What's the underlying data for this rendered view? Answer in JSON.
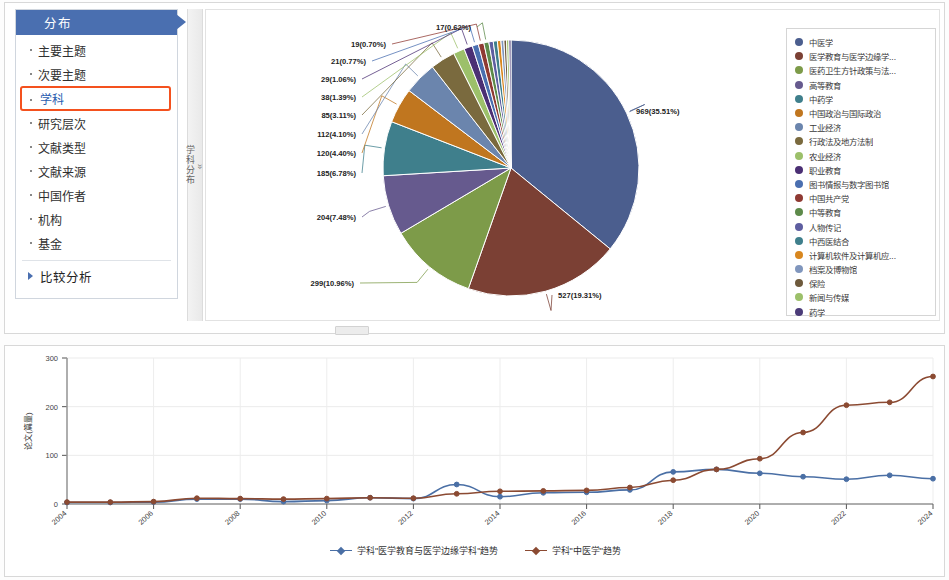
{
  "sidebar": {
    "header": "分布",
    "items": [
      {
        "label": "主要主题",
        "selected": false
      },
      {
        "label": "次要主题",
        "selected": false
      },
      {
        "label": "学科",
        "selected": true
      },
      {
        "label": "研究层次",
        "selected": false
      },
      {
        "label": "文献类型",
        "selected": false
      },
      {
        "label": "文献来源",
        "selected": false
      },
      {
        "label": "中国作者",
        "selected": false
      },
      {
        "label": "机构",
        "selected": false
      },
      {
        "label": "基金",
        "selected": false
      }
    ],
    "footer_item": "比较分析",
    "selected_border_color": "#f4511e",
    "header_color": "#4a6fb0"
  },
  "vertical_tab": {
    "label": "学科分布",
    "chevron": "»"
  },
  "chart_data": [
    {
      "type": "pie",
      "title": "",
      "legend_position": "right",
      "total": 2729,
      "slices": [
        {
          "label": "中医学",
          "value": 969,
          "percent": "35.51%",
          "data_label": "969(35.51%)",
          "color": "#4b5e8e"
        },
        {
          "label": "医学教育与医学边缘学...",
          "value": 527,
          "percent": "19.31%",
          "data_label": "527(19.31%)",
          "color": "#7b4034"
        },
        {
          "label": "医药卫生方针政策与法...",
          "value": 299,
          "percent": "10.96%",
          "data_label": "299(10.96%)",
          "color": "#7d9b49"
        },
        {
          "label": "高等教育",
          "value": 204,
          "percent": "7.48%",
          "data_label": "204(7.48%)",
          "color": "#665a8e"
        },
        {
          "label": "中药学",
          "value": 185,
          "percent": "6.78%",
          "data_label": "185(6.78%)",
          "color": "#3f7f8c"
        },
        {
          "label": "中国政治与国际政治",
          "value": 120,
          "percent": "4.40%",
          "data_label": "120(4.40%)",
          "color": "#c0761f"
        },
        {
          "label": "工业经济",
          "value": 112,
          "percent": "4.10%",
          "data_label": "112(4.10%)",
          "color": "#6b85ad"
        },
        {
          "label": "行政法及地方法制",
          "value": 85,
          "percent": "3.11%",
          "data_label": "85(3.11%)",
          "color": "#7a6a3e"
        },
        {
          "label": "农业经济",
          "value": 38,
          "percent": "1.39%",
          "data_label": "38(1.39%)",
          "color": "#9cc06a"
        },
        {
          "label": "职业教育",
          "value": 29,
          "percent": "1.06%",
          "data_label": "29(1.06%)",
          "color": "#4b2f74"
        },
        {
          "label": "图书情报与数字图书馆",
          "value": 21,
          "percent": "0.77%",
          "data_label": "21(0.77%)",
          "color": "#4a6fb0"
        },
        {
          "label": "中国共产党",
          "value": 19,
          "percent": "0.70%",
          "data_label": "19(0.70%)",
          "color": "#8f3a33"
        },
        {
          "label": "中等教育",
          "value": 17,
          "percent": "0.62%",
          "data_label": "17(0.62%)",
          "color": "#5d8a4a"
        },
        {
          "label": "人物传记",
          "value": 15,
          "percent": "",
          "data_label": "",
          "color": "#5e5ea0"
        },
        {
          "label": "中西医结合",
          "value": 14,
          "percent": "",
          "data_label": "",
          "color": "#3f7f8c"
        },
        {
          "label": "计算机软件及计算机应...",
          "value": 12,
          "percent": "",
          "data_label": "",
          "color": "#d8871f"
        },
        {
          "label": "档案及博物馆",
          "value": 10,
          "percent": "",
          "data_label": "",
          "color": "#8096bd"
        },
        {
          "label": "保险",
          "value": 9,
          "percent": "",
          "data_label": "",
          "color": "#6e5a3c"
        },
        {
          "label": "新闻与传媒",
          "value": 8,
          "percent": "",
          "data_label": "",
          "color": "#9cc06a"
        },
        {
          "label": "药学",
          "value": 7,
          "percent": "",
          "data_label": "",
          "color": "#4b3b78"
        }
      ]
    },
    {
      "type": "line",
      "title": "",
      "ylabel": "论文(篇量)",
      "xlabel": "",
      "ylim": [
        0,
        300
      ],
      "yticks": [
        0,
        100,
        200,
        300
      ],
      "grid": true,
      "legend_position": "bottom",
      "x": [
        2004,
        2005,
        2006,
        2007,
        2008,
        2009,
        2010,
        2011,
        2012,
        2013,
        2014,
        2015,
        2016,
        2017,
        2018,
        2019,
        2020,
        2021,
        2022,
        2023,
        2024
      ],
      "xticks": [
        2004,
        2006,
        2008,
        2010,
        2012,
        2014,
        2016,
        2018,
        2020,
        2022,
        2024
      ],
      "series": [
        {
          "name": "学科\"医学教育与医学边缘学科\"趋势",
          "color": "#4a6fa5",
          "values": [
            3,
            3,
            4,
            10,
            10,
            5,
            7,
            13,
            11,
            40,
            15,
            23,
            24,
            29,
            66,
            71,
            63,
            56,
            51,
            59,
            52
          ]
        },
        {
          "name": "学科\"中医学\"趋势",
          "color": "#8b4a32",
          "values": [
            4,
            4,
            5,
            12,
            11,
            10,
            11,
            13,
            12,
            21,
            26,
            27,
            28,
            34,
            49,
            71,
            93,
            147,
            203,
            209,
            262
          ]
        }
      ]
    }
  ]
}
